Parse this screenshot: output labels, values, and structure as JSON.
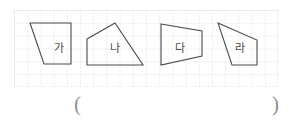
{
  "page": {
    "background_color": "#ffffff",
    "ink_color": "#4a4a4a",
    "grid_color": "#c9c9c9",
    "paren_color": "#8e8e8e"
  },
  "grid": {
    "origin_x": 14,
    "origin_y": 10,
    "width": 264,
    "height": 77,
    "cell_size": 13.2,
    "columns": 20,
    "rows": 6,
    "style": "dashed",
    "visible": true
  },
  "figures": [
    {
      "id": "figure-ga",
      "label": "가",
      "shape": "quadrilateral",
      "label_x": 45,
      "label_y": 38,
      "points": "16,13 57,13 57,54 30,54",
      "vertices": [
        {
          "x": 16,
          "y": 13
        },
        {
          "x": 57,
          "y": 13
        },
        {
          "x": 57,
          "y": 54
        },
        {
          "x": 30,
          "y": 54
        }
      ]
    },
    {
      "id": "figure-na",
      "label": "나",
      "shape": "quadrilateral",
      "label_x": 103,
      "label_y": 38,
      "points": "73,29 101,13 129,55 73,55",
      "vertices": [
        {
          "x": 73,
          "y": 29
        },
        {
          "x": 101,
          "y": 13
        },
        {
          "x": 129,
          "y": 55
        },
        {
          "x": 73,
          "y": 55
        }
      ]
    },
    {
      "id": "figure-da",
      "label": "다",
      "shape": "quadrilateral",
      "label_x": 170,
      "label_y": 38,
      "points": "147,14 188,21 188,46 147,55",
      "vertices": [
        {
          "x": 147,
          "y": 14
        },
        {
          "x": 188,
          "y": 21
        },
        {
          "x": 188,
          "y": 46
        },
        {
          "x": 147,
          "y": 55
        }
      ]
    },
    {
      "id": "figure-ra",
      "label": "라",
      "shape": "quadrilateral",
      "label_x": 229,
      "label_y": 38,
      "points": "204,13 243,30 243,55 218,55",
      "vertices": [
        {
          "x": 204,
          "y": 13
        },
        {
          "x": 243,
          "y": 30
        },
        {
          "x": 243,
          "y": 55
        },
        {
          "x": 218,
          "y": 55
        }
      ]
    }
  ],
  "answer": {
    "open_paren": "(",
    "close_paren": ")",
    "value": "",
    "placeholder": ""
  }
}
